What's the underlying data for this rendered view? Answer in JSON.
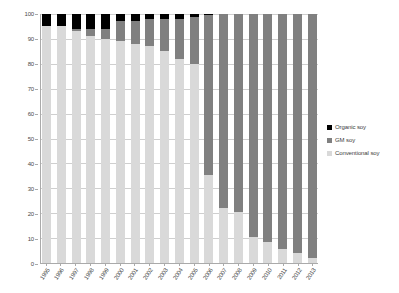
{
  "chart_data": {
    "type": "bar",
    "subtype": "stacked-bar-100-percent",
    "title": "",
    "xlabel": "",
    "ylabel": "",
    "ylim": [
      0,
      100
    ],
    "yticks": [
      0,
      10,
      20,
      30,
      40,
      50,
      60,
      70,
      80,
      90,
      100
    ],
    "grid": true,
    "legend_position": "right",
    "stack_order_bottom_to_top": [
      "Conventional soy",
      "GM soy",
      "Organic soy"
    ],
    "categories": [
      "1995",
      "1996",
      "1997",
      "1998",
      "1999",
      "2000",
      "2001",
      "2002",
      "2003",
      "2004",
      "2005",
      "2006",
      "2007",
      "2008",
      "2009",
      "2010",
      "2011",
      "2012",
      "2013"
    ],
    "series": [
      {
        "name": "Conventional soy",
        "color": "#d9d9d9",
        "values": [
          95,
          95,
          93,
          91,
          90,
          89,
          88,
          87,
          85,
          82,
          80,
          35.5,
          22,
          20.5,
          10.5,
          8.5,
          5.5,
          4,
          2
        ]
      },
      {
        "name": "GM soy",
        "color": "#808080",
        "values": [
          0,
          0,
          1,
          3,
          4,
          8,
          9,
          11,
          13,
          16,
          19,
          64,
          78,
          79.5,
          89.5,
          91.5,
          94.5,
          96,
          98
        ]
      },
      {
        "name": "Organic soy",
        "color": "#000000",
        "values": [
          5,
          5,
          6,
          6,
          6,
          3,
          3,
          2,
          2,
          2,
          1,
          0.5,
          0,
          0,
          0,
          0,
          0,
          0,
          0
        ]
      }
    ]
  },
  "legend": {
    "items": [
      {
        "label": "Organic soy",
        "color": "#000000"
      },
      {
        "label": "GM soy",
        "color": "#808080"
      },
      {
        "label": "Conventional soy",
        "color": "#d9d9d9"
      }
    ]
  }
}
